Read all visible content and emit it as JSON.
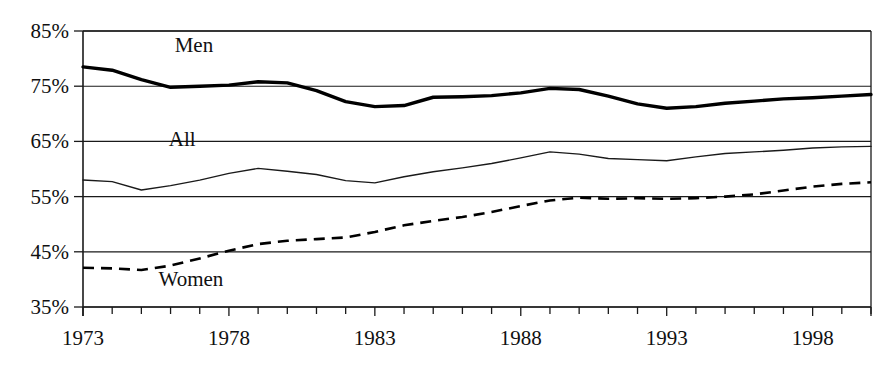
{
  "chart_data": {
    "type": "line",
    "title": "",
    "subtitle": "",
    "xlabel": "",
    "ylabel": "",
    "xlim": [
      1973,
      2000
    ],
    "ylim": [
      35,
      85
    ],
    "y_tick_labels": [
      "85%",
      "75%",
      "65%",
      "55%",
      "45%",
      "35%"
    ],
    "y_ticks": [
      85,
      75,
      65,
      55,
      45,
      35
    ],
    "x_tick_labels": [
      "1973",
      "1978",
      "1983",
      "1988",
      "1993",
      "1998"
    ],
    "x_ticks": [
      1973,
      1978,
      1983,
      1988,
      1993,
      1998
    ],
    "x_minor_ticks_every": 1,
    "grid": "horizontal",
    "legend": "inline-labels",
    "x": [
      1973,
      1974,
      1975,
      1976,
      1977,
      1978,
      1979,
      1980,
      1981,
      1982,
      1983,
      1984,
      1985,
      1986,
      1987,
      1988,
      1989,
      1990,
      1991,
      1992,
      1993,
      1994,
      1995,
      1996,
      1997,
      1998,
      1999,
      2000
    ],
    "series": [
      {
        "name": "Men",
        "style": "thick-solid",
        "label_x": 1976.8,
        "label_y": 81.2,
        "values": [
          78.5,
          77.9,
          76.2,
          74.8,
          75.0,
          75.2,
          75.8,
          75.6,
          74.2,
          72.2,
          71.3,
          71.5,
          73.0,
          73.1,
          73.3,
          73.8,
          74.6,
          74.4,
          73.2,
          71.8,
          71.0,
          71.3,
          71.9,
          72.3,
          72.7,
          72.9,
          73.2,
          73.5
        ]
      },
      {
        "name": "All",
        "style": "thin-solid",
        "label_x": 1976.4,
        "label_y": 64.2,
        "values": [
          58.0,
          57.7,
          56.2,
          57.0,
          58.0,
          59.2,
          60.1,
          59.6,
          59.0,
          57.9,
          57.5,
          58.6,
          59.5,
          60.2,
          61.0,
          62.0,
          63.1,
          62.7,
          61.9,
          61.7,
          61.5,
          62.2,
          62.8,
          63.1,
          63.4,
          63.8,
          64.0,
          64.1
        ]
      },
      {
        "name": "Women",
        "style": "dashed",
        "label_x": 1976.7,
        "label_y": 38.8,
        "values": [
          42.1,
          42.0,
          41.7,
          42.5,
          43.8,
          45.2,
          46.4,
          47.0,
          47.3,
          47.6,
          48.6,
          49.8,
          50.6,
          51.3,
          52.2,
          53.3,
          54.3,
          54.8,
          54.6,
          54.7,
          54.6,
          54.7,
          55.0,
          55.4,
          56.1,
          56.8,
          57.3,
          57.6
        ]
      }
    ],
    "colors": {
      "men": "#000000",
      "all": "#1a1a1a",
      "women": "#000000",
      "axis": "#1a1a1a",
      "background": "#ffffff"
    }
  }
}
